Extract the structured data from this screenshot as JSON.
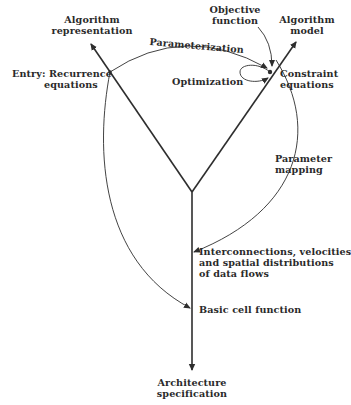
{
  "diagram": {
    "type": "flow-diagram",
    "colors": {
      "ink": "#2a2a2a",
      "background": "#ffffff"
    },
    "labels": {
      "algorithm_representation": [
        "Algorithm",
        "representation"
      ],
      "objective_function": [
        "Objective",
        "function"
      ],
      "algorithm_model": [
        "Algorithm",
        "model"
      ],
      "parameterization": "Parameterization",
      "entry": [
        "Entry: Recurrence",
        "equations"
      ],
      "optimization": "Optimization",
      "constraint_equations": [
        "Constraint",
        "equations"
      ],
      "parameter_mapping": [
        "Parameter",
        "mapping"
      ],
      "interconnections": [
        "Interconnections, velocities",
        "and spatial distributions",
        "of data flows"
      ],
      "basic_cell_function": "Basic cell function",
      "architecture_specification": [
        "Architecture",
        "specification"
      ]
    },
    "nodes": [
      {
        "id": "algorithm_representation",
        "x": 88,
        "y": 20
      },
      {
        "id": "algorithm_model",
        "x": 305,
        "y": 20
      },
      {
        "id": "entry",
        "x": 110,
        "y": 72
      },
      {
        "id": "constraint",
        "x": 270,
        "y": 72
      },
      {
        "id": "fork",
        "x": 192,
        "y": 192
      },
      {
        "id": "interconnections",
        "x": 192,
        "y": 250
      },
      {
        "id": "basic_cell",
        "x": 192,
        "y": 308
      },
      {
        "id": "architecture_specification",
        "x": 192,
        "y": 370
      }
    ],
    "edges": [
      {
        "from": "fork",
        "to": "algorithm_representation",
        "style": "thick-arrow"
      },
      {
        "from": "fork",
        "to": "algorithm_model",
        "style": "thick-arrow"
      },
      {
        "from": "fork",
        "to": "architecture_specification",
        "style": "thick-arrow"
      },
      {
        "from": "entry",
        "to": "constraint",
        "label": "Parameterization",
        "style": "curved-arrow"
      },
      {
        "from": "objective_function",
        "to": "constraint",
        "style": "curved-arrow"
      },
      {
        "from": "constraint",
        "to": "constraint",
        "label": "Optimization",
        "style": "loop"
      },
      {
        "from": "constraint",
        "to": "interconnections",
        "label": "Parameter mapping",
        "style": "curved-arrow"
      },
      {
        "from": "entry",
        "to": "basic_cell",
        "style": "curved-arrow"
      }
    ]
  }
}
